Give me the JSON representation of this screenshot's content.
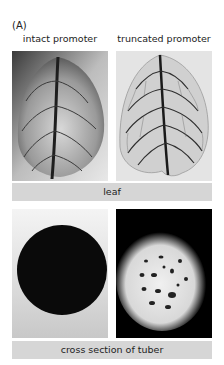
{
  "figure": {
    "panel_label": "(A)",
    "columns": [
      {
        "title": "intact promoter"
      },
      {
        "title": "truncated promoter"
      }
    ],
    "rows": [
      {
        "label": "leaf"
      },
      {
        "label": "cross section of tuber"
      }
    ],
    "colors": {
      "label_bar": "#d6d6d6",
      "background": "#ffffff"
    }
  }
}
